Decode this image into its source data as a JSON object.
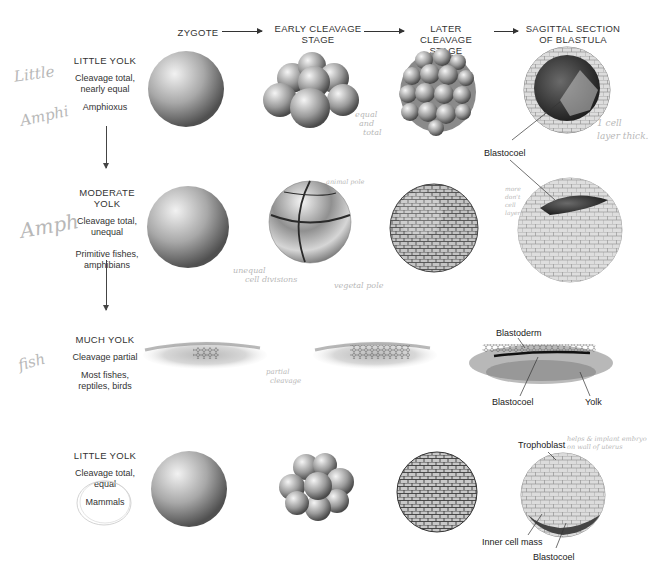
{
  "columns": [
    {
      "id": "zygote",
      "label": "ZYGOTE"
    },
    {
      "id": "early",
      "label": "EARLY CLEAVAGE STAGE",
      "line1": "EARLY CLEAVAGE",
      "line2": "STAGE"
    },
    {
      "id": "later",
      "label": "LATER CLEAVAGE STAGE",
      "line1": "LATER CLEAVAGE",
      "line2": "STAGE"
    },
    {
      "id": "blastula",
      "label": "SAGITTAL SECTION OF BLASTULA",
      "line1": "SAGITTAL SECTION",
      "line2": "OF BLASTULA"
    }
  ],
  "rows": [
    {
      "title": "LITTLE YOLK",
      "cleavage": "Cleavage total, nearly equal",
      "c1": "Cleavage total,",
      "c2": "nearly equal",
      "organisms": "Amphioxus"
    },
    {
      "title": "MODERATE YOLK",
      "cleavage": "Cleavage total, unequal",
      "c1": "Cleavage total,",
      "c2": "unequal",
      "organisms": "Primitive fishes, amphibians",
      "o1": "Primitive fishes,",
      "o2": "amphibians"
    },
    {
      "title": "MUCH YOLK",
      "cleavage": "Cleavage partial",
      "organisms": "Most fishes, reptiles, birds",
      "o1": "Most fishes,",
      "o2": "reptiles, birds"
    },
    {
      "title": "LITTLE YOLK",
      "cleavage": "Cleavage total, equal",
      "c1": "Cleavage total,",
      "c2": "equal",
      "organisms": "Mammals"
    }
  ],
  "labels": {
    "row1_blastocoel": "Blastocoel",
    "row3_blastoderm": "Blastoderm",
    "row3_blastocoel": "Blastocoel",
    "row3_yolk": "Yolk",
    "row4_trophoblast": "Trophoblast",
    "row4_inner_cell_mass": "Inner cell mass",
    "row4_blastocoel": "Blastocoel"
  },
  "handwritten": {
    "margin_row1_a": "Little",
    "margin_row1_b": "Amphi",
    "margin_row2": "Amph",
    "margin_row3": "fish",
    "equal_and_total": [
      "equal",
      "and",
      "total"
    ],
    "one_cell_layer": [
      "1 cell",
      "layer thick."
    ],
    "animal_pole": "animal pole",
    "unequal_cell_divisions": [
      "unequal",
      "cell divisions"
    ],
    "vegetal_pole": "vegetal pole",
    "more_dont_cell": [
      "more",
      "don't",
      "cell",
      "layer"
    ],
    "partial_cleavage": [
      "partial",
      "cleavage"
    ],
    "helps_implant": [
      "helps & implant embryo",
      "on wall of uterus"
    ]
  },
  "colors": {
    "text": "#222222",
    "handwriting": "#b8b8b8",
    "background": "#ffffff"
  }
}
